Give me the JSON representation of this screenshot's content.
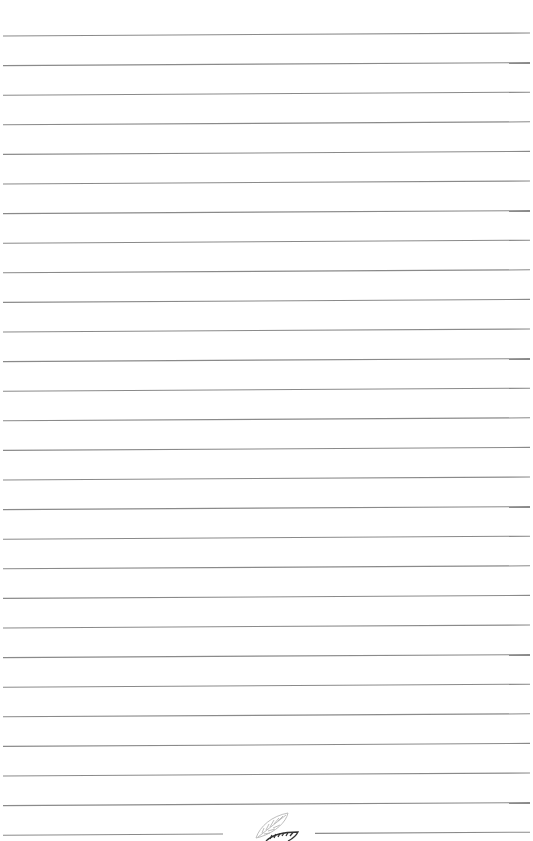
{
  "page": {
    "type": "lined-notebook-page",
    "background_color": "#ffffff",
    "line_color": "#8a8a8a",
    "line_count": 28,
    "line_spacing_px": 29.6,
    "first_line_y": 36,
    "line_left_x": 3,
    "line_right_x": 530,
    "line_tilt_px": 3,
    "bottom_line": {
      "split": true,
      "left_segment_end_x": 223,
      "right_segment_start_x": 315
    }
  },
  "ornament": {
    "icon": "feather-leaf-icon",
    "outline_color": "#b5b5b5",
    "stripe_color": "#333333"
  }
}
